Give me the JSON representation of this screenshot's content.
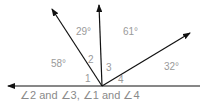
{
  "diagram": {
    "rays": [
      {
        "name": "left-ray",
        "direction_deg": 180
      },
      {
        "name": "upper-left-ray",
        "direction_deg": 122
      },
      {
        "name": "vertical-ray",
        "direction_deg": 93
      },
      {
        "name": "right-ray",
        "direction_deg": 32
      },
      {
        "name": "baseline-right",
        "direction_deg": 0
      }
    ],
    "angle_measures": {
      "a58": "58°",
      "a29": "29°",
      "a61": "61°",
      "a32": "32°"
    },
    "angle_numbers": {
      "n1": "1",
      "n2": "2",
      "n3": "3",
      "n4": "4"
    },
    "caption": "∠2 and ∠3, ∠1 and ∠4",
    "colors": {
      "line": "#111111",
      "label": "#9a9a9a"
    }
  }
}
